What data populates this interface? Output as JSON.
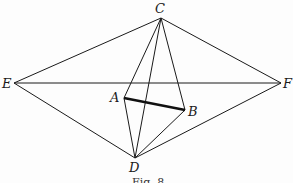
{
  "figure": {
    "caption": "Fig. 8",
    "points": {
      "C": {
        "label": "C",
        "x": 161,
        "y": 18
      },
      "E": {
        "label": "E",
        "x": 14,
        "y": 83
      },
      "F": {
        "label": "F",
        "x": 281,
        "y": 83
      },
      "A": {
        "label": "A",
        "x": 124,
        "y": 98
      },
      "B": {
        "label": "B",
        "x": 185,
        "y": 110
      },
      "D": {
        "label": "D",
        "x": 135,
        "y": 158
      }
    },
    "segments": [
      [
        "C",
        "E"
      ],
      [
        "C",
        "F"
      ],
      [
        "E",
        "F"
      ],
      [
        "E",
        "D"
      ],
      [
        "F",
        "D"
      ],
      [
        "C",
        "A"
      ],
      [
        "C",
        "B"
      ],
      [
        "C",
        "D"
      ],
      [
        "A",
        "D"
      ],
      [
        "B",
        "D"
      ]
    ],
    "bold_segment": [
      "A",
      "B"
    ]
  }
}
